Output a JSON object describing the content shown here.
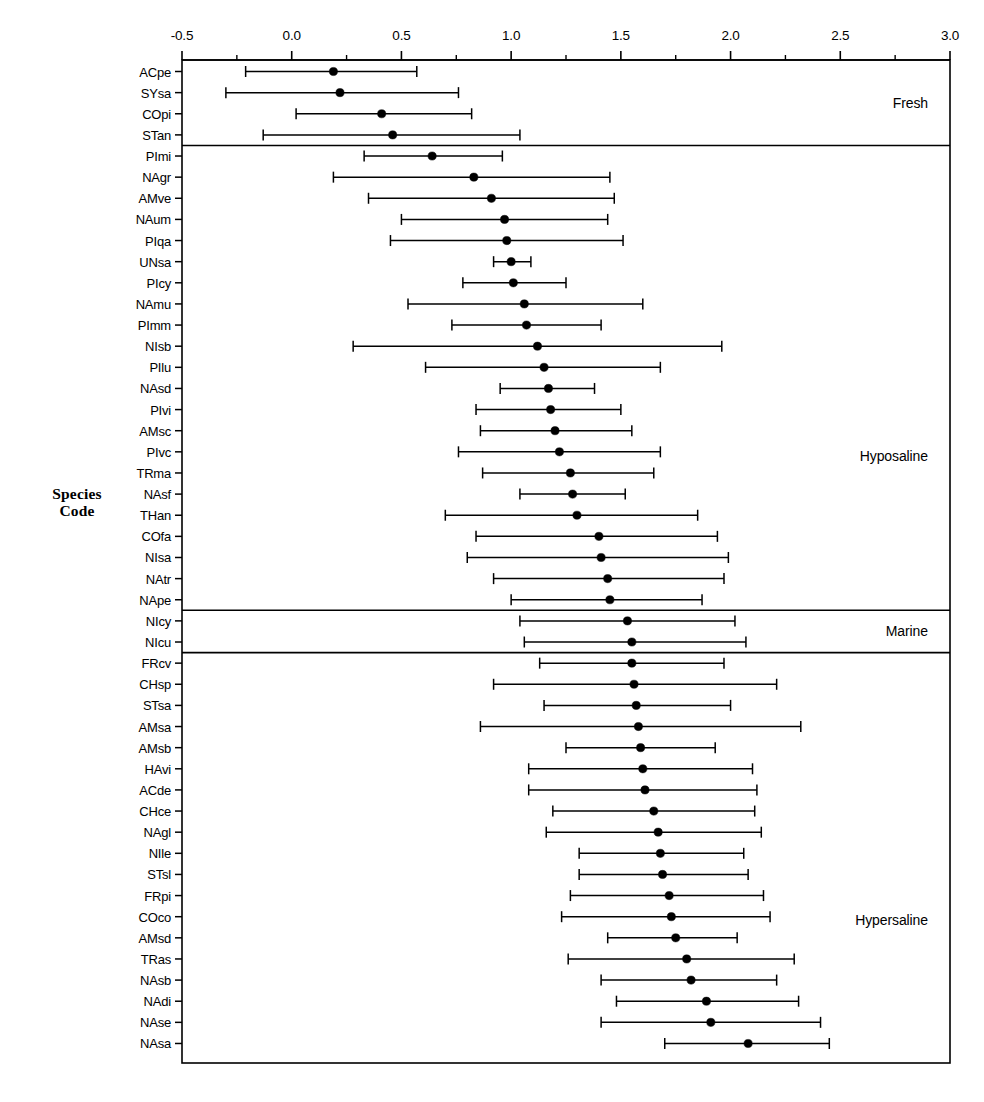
{
  "chart_data": {
    "type": "scatter",
    "subtype": "dot-plot-with-error-bars",
    "title": "",
    "xlabel": "",
    "ylabel": "Species\nCode",
    "xlim": [
      -0.5,
      3.0
    ],
    "x_major_ticks": [
      -0.5,
      0.0,
      0.5,
      1.0,
      1.5,
      2.0,
      2.5,
      3.0
    ],
    "x_minor_tick_step": 0.25,
    "x_tick_labels": [
      "-0.5",
      "0.0",
      "0.5",
      "1.0",
      "1.5",
      "2.0",
      "2.5",
      "3.0"
    ],
    "axis_position": "top",
    "grid": false,
    "legend": null,
    "marker": "filled-circle",
    "error_bar_style": "horizontal-with-caps",
    "categories": [
      "ACpe",
      "SYsa",
      "COpi",
      "STan",
      "PImi",
      "NAgr",
      "AMve",
      "NAum",
      "PIqa",
      "UNsa",
      "PIcy",
      "NAmu",
      "PImm",
      "NIsb",
      "PIlu",
      "NAsd",
      "PIvi",
      "AMsc",
      "PIvc",
      "TRma",
      "NAsf",
      "THan",
      "COfa",
      "NIsa",
      "NAtr",
      "NApe",
      "NIcy",
      "NIcu",
      "FRcv",
      "CHsp",
      "STsa",
      "AMsa",
      "AMsb",
      "HAvi",
      "ACde",
      "CHce",
      "NAgl",
      "NIle",
      "STsl",
      "FRpi",
      "COco",
      "AMsd",
      "TRas",
      "NAsb",
      "NAdi",
      "NAse",
      "NAsa"
    ],
    "values": [
      0.19,
      0.22,
      0.41,
      0.46,
      0.64,
      0.83,
      0.91,
      0.97,
      0.98,
      1.0,
      1.01,
      1.06,
      1.07,
      1.12,
      1.15,
      1.17,
      1.18,
      1.2,
      1.22,
      1.27,
      1.28,
      1.3,
      1.4,
      1.41,
      1.44,
      1.45,
      1.53,
      1.55,
      1.55,
      1.56,
      1.57,
      1.58,
      1.59,
      1.6,
      1.61,
      1.65,
      1.67,
      1.68,
      1.69,
      1.72,
      1.73,
      1.75,
      1.8,
      1.82,
      1.89,
      1.91,
      2.08
    ],
    "lower": [
      -0.21,
      -0.3,
      0.02,
      -0.13,
      0.33,
      0.19,
      0.35,
      0.5,
      0.45,
      0.92,
      0.78,
      0.53,
      0.73,
      0.28,
      0.61,
      0.95,
      0.84,
      0.86,
      0.76,
      0.87,
      1.04,
      0.7,
      0.84,
      0.8,
      0.92,
      1.0,
      1.04,
      1.06,
      1.13,
      0.92,
      1.15,
      0.86,
      1.25,
      1.08,
      1.08,
      1.19,
      1.16,
      1.31,
      1.31,
      1.27,
      1.23,
      1.44,
      1.26,
      1.41,
      1.48,
      1.41,
      1.7
    ],
    "upper": [
      0.57,
      0.76,
      0.82,
      1.04,
      0.96,
      1.45,
      1.47,
      1.44,
      1.51,
      1.09,
      1.25,
      1.6,
      1.41,
      1.96,
      1.68,
      1.38,
      1.5,
      1.55,
      1.68,
      1.65,
      1.52,
      1.85,
      1.94,
      1.99,
      1.97,
      1.87,
      2.02,
      2.07,
      1.97,
      2.21,
      2.0,
      2.32,
      1.93,
      2.1,
      2.12,
      2.11,
      2.14,
      2.06,
      2.08,
      2.15,
      2.18,
      2.03,
      2.29,
      2.21,
      2.31,
      2.41,
      2.45
    ],
    "groups": [
      {
        "label": "Fresh",
        "start_index": 0,
        "end_index": 3
      },
      {
        "label": "Hyposaline",
        "start_index": 4,
        "end_index": 25
      },
      {
        "label": "Marine",
        "start_index": 26,
        "end_index": 27
      },
      {
        "label": "Hypersaline",
        "start_index": 28,
        "end_index": 46
      }
    ],
    "colors": {
      "marker": "#000000",
      "error_bar": "#000000",
      "axis": "#000000",
      "background": "#ffffff"
    }
  }
}
